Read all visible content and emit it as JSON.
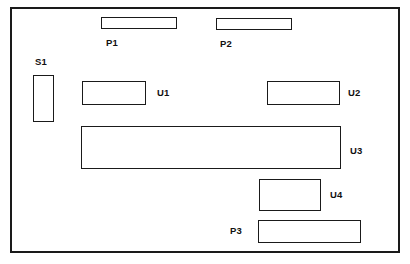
{
  "diagram": {
    "type": "pcb-layout",
    "canvas": {
      "width": 410,
      "height": 264
    },
    "colors": {
      "background": "#ffffff",
      "outline": "#1a1a1a",
      "component_fill": "#ffffff",
      "label_text": "#111111"
    },
    "board": {
      "x": 10,
      "y": 7,
      "width": 390,
      "height": 246
    },
    "components": [
      {
        "ref": "P1",
        "kind": "connector",
        "rect": {
          "x": 101,
          "y": 17,
          "width": 76,
          "height": 12
        },
        "label": {
          "x": 106,
          "y": 38
        }
      },
      {
        "ref": "P2",
        "kind": "connector",
        "rect": {
          "x": 216,
          "y": 18,
          "width": 76,
          "height": 12
        },
        "label": {
          "x": 220,
          "y": 39
        }
      },
      {
        "ref": "S1",
        "kind": "switch",
        "rect": {
          "x": 33,
          "y": 75,
          "width": 21,
          "height": 47
        },
        "label": {
          "x": 35,
          "y": 57
        }
      },
      {
        "ref": "U1",
        "kind": "integrated-circuit",
        "rect": {
          "x": 82,
          "y": 81,
          "width": 64,
          "height": 24
        },
        "label": {
          "x": 157,
          "y": 88
        }
      },
      {
        "ref": "U2",
        "kind": "integrated-circuit",
        "rect": {
          "x": 267,
          "y": 81,
          "width": 73,
          "height": 24
        },
        "label": {
          "x": 348,
          "y": 88
        }
      },
      {
        "ref": "U3",
        "kind": "integrated-circuit",
        "rect": {
          "x": 81,
          "y": 126,
          "width": 260,
          "height": 43
        },
        "label": {
          "x": 350,
          "y": 146
        }
      },
      {
        "ref": "U4",
        "kind": "integrated-circuit",
        "rect": {
          "x": 259,
          "y": 179,
          "width": 62,
          "height": 32
        },
        "label": {
          "x": 330,
          "y": 190
        }
      },
      {
        "ref": "P3",
        "kind": "connector",
        "rect": {
          "x": 258,
          "y": 220,
          "width": 103,
          "height": 23
        },
        "label": {
          "x": 230,
          "y": 226
        }
      }
    ]
  }
}
